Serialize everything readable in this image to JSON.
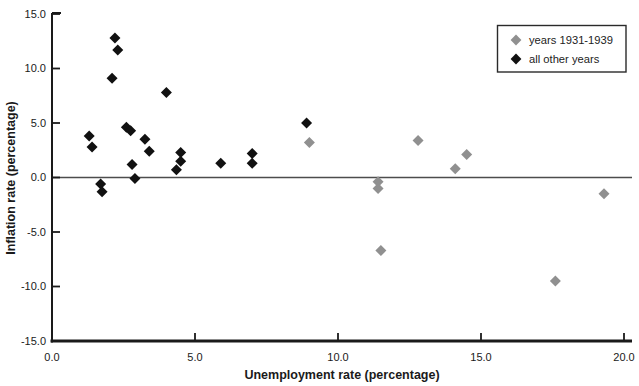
{
  "figure": {
    "background": "#ffffff"
  },
  "chart_data": {
    "type": "scatter",
    "title": "",
    "xlabel": "Unemployment rate (percentage)",
    "ylabel": "Inflation rate (percentage)",
    "xlim": [
      0.0,
      20.0
    ],
    "ylim": [
      -15.0,
      15.0
    ],
    "x_ticks": [
      0.0,
      5.0,
      10.0,
      15.0,
      20.0
    ],
    "x_tick_labels": [
      "0.0",
      "5.0",
      "10.0",
      "15.0",
      "20.0"
    ],
    "y_ticks": [
      15.0,
      10.0,
      5.0,
      0.0,
      -5.0,
      -10.0,
      -15.0
    ],
    "y_tick_labels": [
      "15.0",
      "10.0",
      "5.0",
      "0.0",
      "-5.0",
      "-10.0",
      "-15.0"
    ],
    "grid": false,
    "reference_line_y": 0.0,
    "legend_position": "top-right",
    "marker": "diamond",
    "series": [
      {
        "name": "years 1931-1939",
        "color": "#909090",
        "points": [
          [
            9.0,
            3.2
          ],
          [
            12.8,
            3.4
          ],
          [
            14.5,
            2.1
          ],
          [
            14.1,
            0.8
          ],
          [
            11.4,
            -0.4
          ],
          [
            11.4,
            -1.0
          ],
          [
            11.5,
            -6.7
          ],
          [
            17.6,
            -9.5
          ],
          [
            19.3,
            -1.5
          ]
        ]
      },
      {
        "name": "all other years",
        "color": "#111111",
        "points": [
          [
            2.2,
            12.8
          ],
          [
            2.3,
            11.7
          ],
          [
            2.1,
            9.1
          ],
          [
            4.0,
            7.8
          ],
          [
            2.6,
            4.6
          ],
          [
            2.75,
            4.3
          ],
          [
            1.3,
            3.8
          ],
          [
            1.4,
            2.8
          ],
          [
            3.25,
            3.5
          ],
          [
            3.4,
            2.4
          ],
          [
            2.8,
            1.2
          ],
          [
            2.9,
            -0.1
          ],
          [
            1.7,
            -0.6
          ],
          [
            1.75,
            -1.3
          ],
          [
            4.5,
            2.3
          ],
          [
            4.5,
            1.5
          ],
          [
            4.35,
            0.7
          ],
          [
            5.9,
            1.3
          ],
          [
            7.0,
            2.2
          ],
          [
            7.0,
            1.3
          ],
          [
            8.9,
            5.0
          ]
        ]
      }
    ]
  },
  "colors": {
    "axis": "#1a1a1a",
    "zero_line": "#4d4d4d",
    "legend_border": "#2a2a2a",
    "legend_background": "#ffffff"
  }
}
